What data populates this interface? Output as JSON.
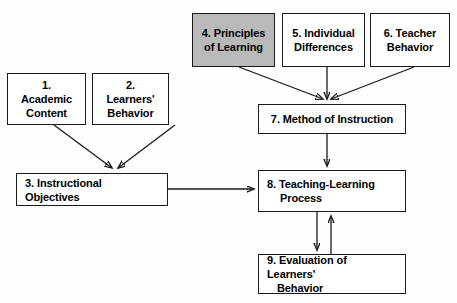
{
  "diagram": {
    "background_color": "#fefefe",
    "line_color": "#1a1a1a",
    "shaded_fill": "#b9b9b9",
    "box_fill": "#ffffff"
  },
  "nodes": [
    {
      "id": "academic-content",
      "number": "1.",
      "line1": "1. Academic",
      "line2": "Content",
      "shaded": false,
      "align": "center"
    },
    {
      "id": "learners-behavior",
      "number": "2.",
      "line1": "2. Learners'",
      "line2": "Behavior",
      "shaded": false,
      "align": "center"
    },
    {
      "id": "instructional-objectives",
      "number": "3.",
      "line1": "3. Instructional Objectives",
      "line2": "",
      "shaded": false,
      "align": "left"
    },
    {
      "id": "principles-of-learning",
      "number": "4.",
      "line1": "4. Principles",
      "line2": "of Learning",
      "shaded": true,
      "align": "center"
    },
    {
      "id": "individual-differences",
      "number": "5.",
      "line1": "5. Individual",
      "line2": "Differences",
      "shaded": false,
      "align": "center"
    },
    {
      "id": "teacher-behavior",
      "number": "6.",
      "line1": "6. Teacher",
      "line2": "Behavior",
      "shaded": false,
      "align": "center"
    },
    {
      "id": "method-of-instruction",
      "number": "7.",
      "line1": "7. Method of Instruction",
      "line2": "",
      "shaded": false,
      "align": "center"
    },
    {
      "id": "teaching-learning-process",
      "number": "8.",
      "line1": "8. Teaching-Learning",
      "line2": "Process",
      "shaded": false,
      "align": "left"
    },
    {
      "id": "evaluation-of-learners-behavior",
      "number": "9.",
      "line1": "9. Evaluation of Learners'",
      "line2": "Behavior",
      "shaded": false,
      "align": "left"
    }
  ],
  "edges": [
    {
      "from": "academic-content",
      "to": "instructional-objectives",
      "kind": "arrow"
    },
    {
      "from": "learners-behavior",
      "to": "instructional-objectives",
      "kind": "arrow"
    },
    {
      "from": "principles-of-learning",
      "to": "method-of-instruction",
      "kind": "arrow"
    },
    {
      "from": "individual-differences",
      "to": "method-of-instruction",
      "kind": "arrow"
    },
    {
      "from": "teacher-behavior",
      "to": "method-of-instruction",
      "kind": "arrow"
    },
    {
      "from": "instructional-objectives",
      "to": "teaching-learning-process",
      "kind": "arrow"
    },
    {
      "from": "method-of-instruction",
      "to": "teaching-learning-process",
      "kind": "arrow"
    },
    {
      "from": "teaching-learning-process",
      "to": "evaluation-of-learners-behavior",
      "kind": "arrow"
    },
    {
      "from": "evaluation-of-learners-behavior",
      "to": "teaching-learning-process",
      "kind": "arrow"
    }
  ]
}
